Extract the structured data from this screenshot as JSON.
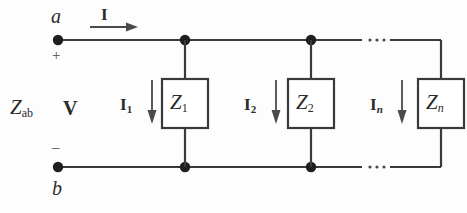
{
  "figure": {
    "name": "parallel-impedance-network",
    "stroke_color": "#3a3a3a",
    "text_color": "#2b2b2b",
    "background": "#fdfdfd"
  },
  "terminals": {
    "top_label": "a",
    "bottom_label": "b",
    "plus_sign": "+",
    "minus_sign": "–"
  },
  "source": {
    "impedance_label": "Z",
    "impedance_subscript": "ab",
    "voltage_label": "V"
  },
  "total_current": {
    "label": "I",
    "arrow": "right-arrow"
  },
  "branches": [
    {
      "current_label": "I",
      "current_subscript": "1",
      "subscript_italic": false,
      "impedance_label": "Z",
      "impedance_subscript": "1",
      "arrow": "down-arrow"
    },
    {
      "current_label": "I",
      "current_subscript": "2",
      "subscript_italic": false,
      "impedance_label": "Z",
      "impedance_subscript": "2",
      "arrow": "down-arrow"
    },
    {
      "current_label": "I",
      "current_subscript": "n",
      "subscript_italic": true,
      "impedance_label": "Z",
      "impedance_subscript": "n",
      "arrow": "down-arrow"
    }
  ],
  "ellipsis": {
    "symbol": "· · ·",
    "count": 2
  }
}
